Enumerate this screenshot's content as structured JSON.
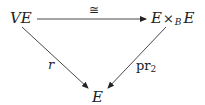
{
  "diagram": {
    "type": "commutative-triangle",
    "nodes": {
      "top_left": {
        "main": "VE"
      },
      "top_right": {
        "left": "E",
        "op": "×",
        "sub": "B",
        "right": "E"
      },
      "bottom": {
        "main": "E"
      }
    },
    "arrows": {
      "top": {
        "from": "VE",
        "to": "E ×_B E",
        "label": "≅"
      },
      "left": {
        "from": "VE",
        "to": "E",
        "label": "r"
      },
      "right": {
        "from": "E ×_B E",
        "to": "E",
        "label_main": "pr",
        "label_sub": "2"
      }
    },
    "colors": {
      "ink": "#222222",
      "background": "#ffffff"
    }
  }
}
